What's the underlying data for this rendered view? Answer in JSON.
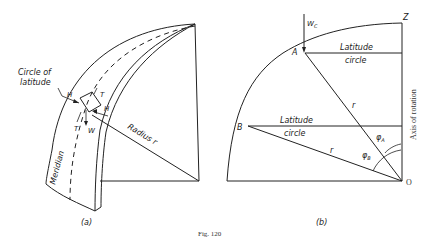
{
  "figure": {
    "caption": "Fig. 120",
    "panel_a": {
      "label": "(a)",
      "circle_of_latitude_line1": "Circle of",
      "circle_of_latitude_line2": "latitude",
      "meridian": "Meridian",
      "radius": "Radius r",
      "force_h_left": "H",
      "force_h_right": "H",
      "force_t_top": "T",
      "force_t_bottom": "T",
      "force_w": "W"
    },
    "panel_b": {
      "label": "(b)",
      "point_z": "Z",
      "point_a": "A",
      "point_b": "B",
      "point_o": "O",
      "load_wc": "W",
      "load_wc_sub": "C",
      "latitude_circle_top_1": "Latitude",
      "latitude_circle_top_2": "circle",
      "latitude_circle_bottom_1": "Latitude",
      "latitude_circle_bottom_2": "circle",
      "radius_r_upper": "r",
      "radius_r_lower": "r",
      "angle_phi_a": "φ",
      "angle_phi_a_sub": "A",
      "angle_phi_b": "φ",
      "angle_phi_b_sub": "B",
      "axis_of_rotation": "Axis of rotation"
    }
  }
}
